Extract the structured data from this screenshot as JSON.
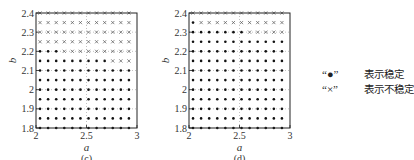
{
  "chart_data": [
    {
      "type": "scatter",
      "panel_label": "(c)",
      "xlabel": "a",
      "ylabel": "b",
      "xlim": [
        2,
        3
      ],
      "ylim": [
        1.8,
        2.4
      ],
      "x_ticks": [
        "2",
        "2.5",
        "3"
      ],
      "x_tick_values": [
        2,
        2.5,
        3
      ],
      "y_ticks": [
        "1.8",
        "1.9",
        "2",
        "2.1",
        "2.2",
        "2.3",
        "2.4"
      ],
      "y_tick_values": [
        1.8,
        1.9,
        2.0,
        2.1,
        2.2,
        2.3,
        2.4
      ],
      "grid": "dotted",
      "a_values": [
        2.04,
        2.12,
        2.2,
        2.28,
        2.36,
        2.44,
        2.52,
        2.6,
        2.68,
        2.76,
        2.84,
        2.92
      ],
      "b_values": [
        2.4,
        2.35,
        2.3,
        2.25,
        2.2,
        2.15,
        2.1,
        2.05,
        2.0,
        1.95,
        1.9,
        1.85,
        1.8
      ],
      "stability_rows": [
        "xxxxxxxxxxxx",
        "xxxxxxxxxxxx",
        "xxxxxxxxxxxx",
        "xxxxxxxxxxxx",
        "oooxxxxxxxxx",
        "oooooooooxxx",
        "oooooooooooo",
        "oooooooooooo",
        "oooooooooooo",
        "oooooooooooo",
        "oooooooooooo",
        "oooooooooooo",
        "oooooooooooo"
      ]
    },
    {
      "type": "scatter",
      "panel_label": "(d)",
      "xlabel": "a",
      "ylabel": "b",
      "xlim": [
        2,
        3
      ],
      "ylim": [
        1.8,
        2.4
      ],
      "x_ticks": [
        "2",
        "2.5",
        "3"
      ],
      "x_tick_values": [
        2,
        2.5,
        3
      ],
      "y_ticks": [
        "1.8",
        "1.9",
        "2",
        "2.1",
        "2.2",
        "2.3",
        "2.4"
      ],
      "y_tick_values": [
        1.8,
        1.9,
        2.0,
        2.1,
        2.2,
        2.3,
        2.4
      ],
      "grid": "dotted",
      "a_values": [
        2.04,
        2.12,
        2.2,
        2.28,
        2.36,
        2.44,
        2.52,
        2.6,
        2.68,
        2.76,
        2.84,
        2.92
      ],
      "b_values": [
        2.4,
        2.35,
        2.3,
        2.25,
        2.2,
        2.15,
        2.1,
        2.05,
        2.0,
        1.95,
        1.9,
        1.85,
        1.8
      ],
      "stability_rows": [
        "xxxxxxxxxxxx",
        "oxxxxxxxxxxx",
        "oooooooxxxxx",
        "oooooooooooo",
        "oooooooooooo",
        "oooooooooooo",
        "oooooooooooo",
        "oooooooooooo",
        "oooooooooooo",
        "oooooooooooo",
        "oooooooooooo",
        "oooooooooooo",
        "oooooooooooo"
      ]
    }
  ],
  "legend": {
    "placement": "right",
    "entries": [
      {
        "symbol": "“●”",
        "meaning": "表示稳定",
        "marker": "stable"
      },
      {
        "symbol": "“×”",
        "meaning": "表示不稳定",
        "marker": "unstable"
      }
    ]
  }
}
